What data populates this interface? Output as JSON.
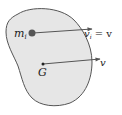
{
  "diagram": {
    "body": {
      "fill": "#e6e6e6",
      "stroke": "#555555"
    },
    "particle": {
      "label": "m",
      "subscript": "i",
      "color": "#555555"
    },
    "particle_velocity": {
      "label": "v",
      "subscript": "i",
      "suffix": " = v"
    },
    "center_of_mass": {
      "label": "G"
    },
    "cm_velocity": {
      "label": "v"
    },
    "arrow_color": "#555555"
  }
}
